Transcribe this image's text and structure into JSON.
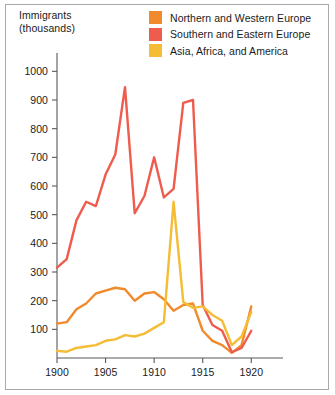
{
  "figure": {
    "background_color": "#ffffff",
    "border_color": "#a8a9ad"
  },
  "axis_title": "Immigrants\n(thousands)",
  "legend": {
    "items": [
      {
        "label": "Northern and Western Europe",
        "color": "#F08A2C",
        "swatch_name": "legend-swatch-northern-western-europe"
      },
      {
        "label": "Southern and Eastern Europe",
        "color": "#EE5C4D",
        "swatch_name": "legend-swatch-southern-eastern-europe"
      },
      {
        "label": "Asia, Africa, and America",
        "color": "#F5BC35",
        "swatch_name": "legend-swatch-asia-africa-america"
      }
    ]
  },
  "chart_data": {
    "type": "line",
    "title": "Immigrants (thousands)",
    "xlabel": "",
    "ylabel": "Immigrants (thousands)",
    "xlim": [
      1900,
      1921
    ],
    "ylim": [
      0,
      1050
    ],
    "yticks": [
      100,
      200,
      300,
      400,
      500,
      600,
      700,
      800,
      900,
      1000
    ],
    "xticks": [
      1900,
      1905,
      1910,
      1915,
      1920
    ],
    "grid": false,
    "legend_position": "top-right",
    "x": [
      1900,
      1901,
      1902,
      1903,
      1904,
      1905,
      1906,
      1907,
      1908,
      1909,
      1910,
      1911,
      1912,
      1913,
      1914,
      1915,
      1916,
      1917,
      1918,
      1919,
      1920
    ],
    "series": [
      {
        "name": "Northern and Western Europe",
        "color": "#F08A2C",
        "values": [
          120,
          125,
          170,
          190,
          225,
          235,
          245,
          240,
          200,
          225,
          230,
          205,
          165,
          185,
          190,
          95,
          60,
          45,
          18,
          45,
          180
        ]
      },
      {
        "name": "Southern and Eastern Europe",
        "color": "#EE5C4D",
        "values": [
          315,
          345,
          480,
          545,
          530,
          640,
          710,
          945,
          505,
          565,
          700,
          560,
          590,
          890,
          900,
          185,
          115,
          95,
          20,
          35,
          95
        ]
      },
      {
        "name": "Asia, Africa, and America",
        "color": "#F5BC35",
        "values": [
          25,
          22,
          35,
          40,
          45,
          60,
          65,
          80,
          75,
          85,
          105,
          125,
          545,
          195,
          175,
          180,
          150,
          130,
          45,
          75,
          160
        ]
      }
    ]
  },
  "plot_geometry": {
    "x_origin_px": 57,
    "x_end_px": 261,
    "y_origin_px": 358,
    "y_top_px": 57,
    "year_min": 1900,
    "year_max": 1921,
    "value_min": 0,
    "value_max": 1050,
    "tick_length_px": 5
  }
}
